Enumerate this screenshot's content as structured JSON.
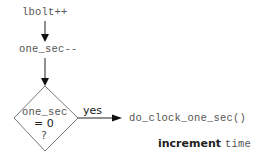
{
  "diagram": {
    "nodes": {
      "step1": "lbolt++",
      "step2": "one_sec--",
      "decision": {
        "line1": "one_sec",
        "line2": "= 0",
        "line3": "?"
      },
      "action": "do_clock_one_sec()"
    },
    "edges": {
      "yes_label": "yes"
    },
    "annotation": {
      "bold": "increment",
      "mono": "time"
    }
  }
}
